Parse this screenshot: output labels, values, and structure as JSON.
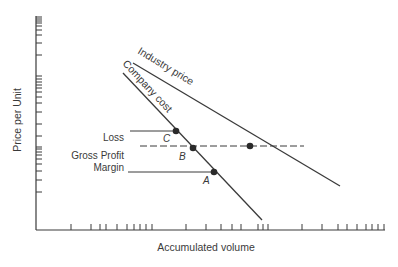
{
  "chart_data": {
    "type": "line",
    "title": "",
    "xlabel": "Accumulated volume",
    "ylabel": "Price per Unit",
    "axis_scale": "log-log",
    "grid": false,
    "legend": "none (lines labeled inline)",
    "series": [
      {
        "name": "Industry price",
        "x1": 133,
        "y1": 63,
        "x2": 340,
        "y2": 186,
        "label_x": 137,
        "label_y": 53,
        "label_angle": 31
      },
      {
        "name": "Company cost",
        "x1": 123,
        "y1": 73,
        "x2": 262,
        "y2": 220,
        "label_x": 122,
        "label_y": 64,
        "label_angle": 47
      }
    ],
    "points": [
      {
        "id": "C",
        "x": 176,
        "y": 131,
        "label_x": 163,
        "label_y": 142
      },
      {
        "id": "B",
        "x": 193,
        "y": 148,
        "label_x": 179,
        "label_y": 160
      },
      {
        "id": "A",
        "x": 214,
        "y": 172,
        "label_x": 203,
        "label_y": 184
      },
      {
        "id": "",
        "x": 250,
        "y": 146
      }
    ],
    "reference_lines": [
      {
        "name": "loss-line",
        "style": "solid",
        "x1": 130,
        "x2": 176,
        "y": 131
      },
      {
        "name": "price-level-dashed",
        "style": "dashed",
        "x1": 140,
        "x2": 304,
        "y": 146
      },
      {
        "name": "margin-line",
        "style": "solid",
        "x1": 128,
        "x2": 214,
        "y": 172
      }
    ],
    "annotations": [
      {
        "text": "Loss",
        "x": 124,
        "y": 141
      },
      {
        "text": "Gross Profit",
        "x": 124,
        "y": 159
      },
      {
        "text": "Margin",
        "x": 124,
        "y": 171
      }
    ],
    "x_ticks_px": [
      71,
      91,
      100,
      106,
      117,
      127,
      134,
      140,
      146,
      152,
      186,
      206,
      221,
      232,
      241,
      258,
      263,
      268,
      302,
      322,
      338,
      347,
      357,
      366,
      372,
      378,
      384
    ],
    "y_ticks_px": [
      17,
      19,
      21,
      23,
      26,
      30,
      35,
      43,
      55,
      76,
      79,
      82,
      85,
      88,
      92,
      97,
      103,
      112,
      124,
      136,
      147,
      149,
      152,
      155,
      159,
      164,
      171,
      180,
      192
    ],
    "axes": {
      "origin_x": 36,
      "origin_y": 230,
      "x_end": 384,
      "y_top": 17
    }
  },
  "labels": {
    "ylabel": "Price per Unit",
    "xlabel": "Accumulated volume",
    "industry_price": "Industry price",
    "company_cost": "Company cost",
    "loss": "Loss",
    "gross_profit": "Gross Profit",
    "margin": "Margin",
    "point_a": "A",
    "point_b": "B",
    "point_c": "C"
  },
  "colors": {
    "ink": "#3a3a3a",
    "background": "#ffffff"
  }
}
